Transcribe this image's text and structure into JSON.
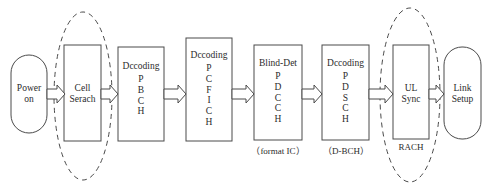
{
  "diagram": {
    "type": "flowchart",
    "orientation": "left-to-right",
    "colors": {
      "stroke": "#4a4a4a",
      "fill": "#ffffff",
      "text": "#2b2b2b",
      "background": "#ffffff"
    },
    "nodes": [
      {
        "id": "power-on",
        "shape": "stadium",
        "head": "",
        "label": "Power\non",
        "stack": [],
        "caption": ""
      },
      {
        "id": "cell-search",
        "shape": "rectangle",
        "head": "",
        "label": "Cell\nSerach",
        "stack": [],
        "caption": ""
      },
      {
        "id": "decoding-pbch",
        "shape": "rectangle",
        "head": "Dccoding",
        "label": "",
        "stack": [
          "P",
          "B",
          "C",
          "H"
        ],
        "caption": ""
      },
      {
        "id": "decoding-pcfich",
        "shape": "rectangle",
        "head": "Dccoding",
        "label": "",
        "stack": [
          "P",
          "C",
          "F",
          "I",
          "C",
          "H"
        ],
        "caption": ""
      },
      {
        "id": "blind-det-pdcch",
        "shape": "rectangle",
        "head": "Blind-Det",
        "label": "",
        "stack": [
          "P",
          "D",
          "C",
          "C",
          "H"
        ],
        "caption": "（format IC）"
      },
      {
        "id": "decoding-pdsch",
        "shape": "rectangle",
        "head": "Dccoding",
        "label": "",
        "stack": [
          "P",
          "D",
          "S",
          "C",
          "H"
        ],
        "caption": "（D-BCH）"
      },
      {
        "id": "ul-sync",
        "shape": "rectangle",
        "head": "",
        "label": "UL\nSync",
        "stack": [],
        "caption": ""
      },
      {
        "id": "link-setup",
        "shape": "stadium",
        "head": "",
        "label": "Link\nSetup",
        "stack": [],
        "caption": ""
      }
    ],
    "groups": [
      {
        "id": "cell-search-group",
        "label": "",
        "encloses": "cell-search"
      },
      {
        "id": "rach-group",
        "label": "RACH",
        "encloses": "ul-sync"
      }
    ],
    "edges": [
      {
        "from": "power-on",
        "to": "cell-search",
        "style": "block-arrow"
      },
      {
        "from": "cell-search",
        "to": "decoding-pbch",
        "style": "block-arrow"
      },
      {
        "from": "decoding-pbch",
        "to": "decoding-pcfich",
        "style": "block-arrow"
      },
      {
        "from": "decoding-pcfich",
        "to": "blind-det-pdcch",
        "style": "block-arrow"
      },
      {
        "from": "blind-det-pdcch",
        "to": "decoding-pdsch",
        "style": "block-arrow"
      },
      {
        "from": "decoding-pdsch",
        "to": "ul-sync",
        "style": "block-arrow"
      },
      {
        "from": "ul-sync",
        "to": "link-setup",
        "style": "block-arrow"
      }
    ]
  }
}
